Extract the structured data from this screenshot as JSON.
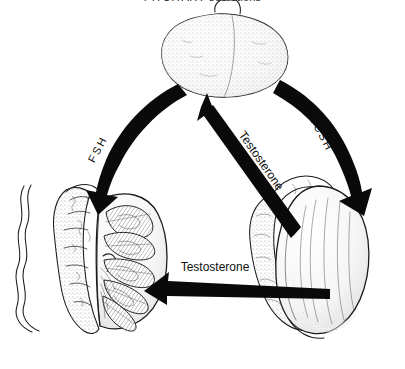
{
  "caption": {
    "title": "PITUITARY",
    "subtitle": "secretions"
  },
  "figure": {
    "kind": "anatomical-flow-diagram"
  },
  "organs": [
    {
      "id": "pituitary",
      "name": "pituitary-gland",
      "label": "PITUITARY"
    },
    {
      "id": "testis-section",
      "name": "testis-cross-section",
      "label": ""
    },
    {
      "id": "testis-whole",
      "name": "testis-whole-with-epididymis",
      "label": ""
    }
  ],
  "arrows": [
    {
      "id": "fsh",
      "name": "fsh-arrow",
      "label": "FSH",
      "from": "pituitary",
      "to": "testis-section",
      "style": "curved",
      "color": "#0a0a0a"
    },
    {
      "id": "icsh",
      "name": "icsh-arrow",
      "label": "ICSH",
      "from": "pituitary",
      "to": "testis-whole",
      "style": "curved",
      "color": "#0a0a0a"
    },
    {
      "id": "testosterone-feedback",
      "name": "testosterone-feedback-arrow",
      "label": "Testosterone",
      "from": "testis-whole",
      "to": "pituitary",
      "style": "straight",
      "color": "#0a0a0a"
    },
    {
      "id": "testosterone-local",
      "name": "testosterone-local-arrow",
      "label": "Testosterone",
      "from": "testis-whole",
      "to": "testis-section",
      "style": "straight",
      "color": "#0a0a0a"
    }
  ],
  "colors": {
    "ink": "#0a0a0a",
    "outline": "#1b1b1b",
    "background": "#ffffff"
  }
}
